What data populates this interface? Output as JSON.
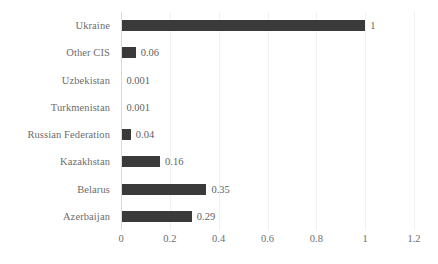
{
  "chart_data": {
    "type": "bar",
    "orientation": "horizontal",
    "title": "",
    "xlabel": "",
    "ylabel": "",
    "categories": [
      "Ukraine",
      "Other CIS",
      "Uzbekistan",
      "Turkmenistan",
      "Russian Federation",
      "Kazakhstan",
      "Belarus",
      "Azerbaijan"
    ],
    "values": [
      1,
      0.06,
      0.001,
      0.001,
      0.04,
      0.16,
      0.35,
      0.29
    ],
    "value_labels": [
      "1",
      "0.06",
      "0.001",
      "0.001",
      "0.04",
      "0.16",
      "0.35",
      "0.29"
    ],
    "xlim": [
      0,
      1.2
    ],
    "xticks": [
      0,
      0.2,
      0.4,
      0.6,
      0.8,
      1,
      1.2
    ],
    "xtick_labels": [
      "0",
      "0.2",
      "0.4",
      "0.6",
      "0.8",
      "1",
      "1.2"
    ],
    "grid": "vertical",
    "legend": null,
    "bar_color": "#3a3a3a",
    "gridline_color": "#f1f1f1",
    "axis_color": "#d9d9d9",
    "label_color": "#6d6d6d",
    "value_label_color": "#5f5f5f"
  }
}
